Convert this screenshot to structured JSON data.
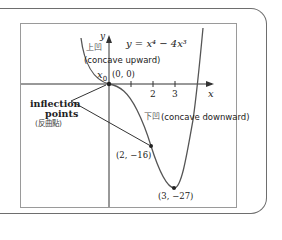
{
  "figure": {
    "equation": "y = x⁴ − 4x³",
    "x_axis_label": "x",
    "y_axis_label": "y",
    "x_ticks": [
      "2",
      "3"
    ],
    "origin_point_label": "(0, 0)",
    "origin_x_label": "x",
    "origin_x_subscript": "0",
    "concave_up_cn": "上凹",
    "concave_up_en": "(concave upward)",
    "concave_down_cn": "下凹",
    "concave_down_en": "(concave downward)",
    "inflection_label_line1": "inflection",
    "inflection_label_line2": "points",
    "inflection_label_cn": "(反曲點)",
    "point_2_label": "(2, −16)",
    "minimum_label": "(3, −27)"
  },
  "colors": {
    "curve": "#555555",
    "axis": "#333333",
    "frame": "#6e6e6e",
    "plotbox": "#9a9a9a",
    "text": "#222222"
  }
}
